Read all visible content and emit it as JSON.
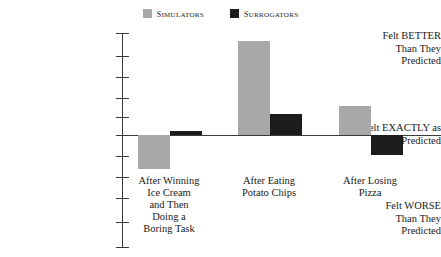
{
  "legend": {
    "entries": [
      {
        "label": "Simulators",
        "color": "#a8a8a8"
      },
      {
        "label": "Surrogators",
        "color": "#1c1c1c"
      }
    ]
  },
  "y_axis": {
    "top_label": "Felt BETTER Than They Predicted",
    "top_line1": "Felt BETTER",
    "top_line2": "Than They",
    "top_line3": "Predicted",
    "middle_label": "Felt EXACTLY as They Predicted",
    "middle_line1": "Felt EXACTLY as",
    "middle_line2": "They Predicted",
    "bottom_label": "Felt WORSE Than They Predicted",
    "bottom_line1": "Felt WORSE",
    "bottom_line2": "Than They",
    "bottom_line3": "Predicted"
  },
  "categories": {
    "c0_line1": "After Winning",
    "c0_line2": "Ice Cream",
    "c0_line3": "and Then",
    "c0_line4": "Doing a",
    "c0_line5": "Boring Task",
    "c1_line1": "After Eating",
    "c1_line2": "Potato Chips",
    "c2_line1": "After Losing",
    "c2_line2": "Pizza"
  },
  "chart_data": {
    "type": "bar",
    "title": "",
    "xlabel": "",
    "ylabel": "Felt BETTER / EXACTLY as / WORSE Than They Predicted",
    "categories": [
      "After Winning Ice Cream and Then Doing a Boring Task",
      "After Eating Potato Chips",
      "After Losing Pizza"
    ],
    "series": [
      {
        "name": "Simulators",
        "color": "#a8a8a8",
        "values": [
          -1.6,
          4.4,
          1.35
        ]
      },
      {
        "name": "Surrogators",
        "color": "#1c1c1c",
        "values": [
          0.2,
          1.0,
          -0.95
        ]
      }
    ],
    "ylim": [
      -4.8,
      4.8
    ],
    "zero_label": "Felt EXACTLY as They Predicted",
    "grid": false,
    "legend_position": "top-center",
    "y_tick_count": 10,
    "axis_note": "Unlabeled evenly spaced tick marks; zero line aligned with 'Felt EXACTLY as They Predicted'"
  }
}
